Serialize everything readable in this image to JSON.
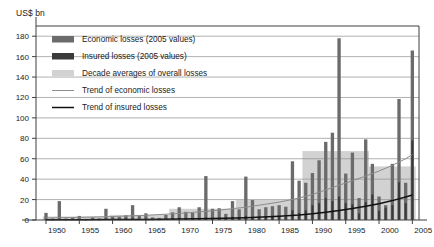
{
  "chart_data": {
    "type": "bar",
    "title": "",
    "subtitle": "",
    "xlabel": "",
    "ylabel": "US$ bn",
    "ylim": [
      0,
      190
    ],
    "xlim": [
      1948.5,
      2006.0
    ],
    "yticks": [
      0,
      20,
      40,
      60,
      80,
      100,
      120,
      140,
      160,
      180
    ],
    "xticks": [
      1950,
      1955,
      1960,
      1965,
      1970,
      1975,
      1980,
      1985,
      1990,
      1995,
      2000,
      2005
    ],
    "grid": true,
    "legend_position": "upper-left-inside",
    "x": [
      1950,
      1951,
      1952,
      1953,
      1954,
      1955,
      1956,
      1957,
      1958,
      1959,
      1960,
      1961,
      1962,
      1963,
      1964,
      1965,
      1966,
      1967,
      1968,
      1969,
      1970,
      1971,
      1972,
      1973,
      1974,
      1975,
      1976,
      1977,
      1978,
      1979,
      1980,
      1981,
      1982,
      1983,
      1984,
      1985,
      1986,
      1987,
      1988,
      1989,
      1990,
      1991,
      1992,
      1993,
      1994,
      1995,
      1996,
      1997,
      1998,
      1999,
      2000,
      2001,
      2002,
      2003,
      2004,
      2005
    ],
    "series": [
      {
        "name": "Economic losses (2005 values)",
        "color": "#6b6b6b",
        "values": [
          7.0,
          1.5,
          18.5,
          1.5,
          2.0,
          4.0,
          1.0,
          2.5,
          1.5,
          11.0,
          3.5,
          3.0,
          4.5,
          14.5,
          4.5,
          6.5,
          2.5,
          2.0,
          5.0,
          7.5,
          12.5,
          8.0,
          7.0,
          12.5,
          43.0,
          11.0,
          11.5,
          6.0,
          18.5,
          10.5,
          42.5,
          19.5,
          10.5,
          12.5,
          13.5,
          14.5,
          13.0,
          57.5,
          38.5,
          36.5,
          46.0,
          58.5,
          76.5,
          85.5,
          178.0,
          45.5,
          66.0,
          21.5,
          79.0,
          55.0,
          23.0,
          14.5,
          55.0,
          118.5,
          36.5,
          166.0
        ]
      },
      {
        "name": "Insured losses (2005 values)",
        "color": "#3a3a3a",
        "values": [
          1.0,
          0.3,
          1.5,
          0.3,
          0.5,
          0.8,
          0.2,
          0.4,
          0.3,
          1.2,
          0.6,
          0.5,
          1.5,
          1.5,
          0.8,
          1.2,
          0.5,
          0.4,
          0.8,
          1.5,
          2.0,
          1.5,
          1.5,
          1.5,
          2.5,
          2.0,
          2.0,
          1.2,
          3.0,
          2.5,
          4.0,
          3.0,
          2.0,
          3.0,
          3.5,
          4.0,
          3.0,
          9.5,
          7.0,
          9.5,
          14.5,
          16.5,
          21.5,
          18.5,
          23.0,
          16.5,
          15.5,
          6.5,
          17.5,
          25.0,
          9.0,
          12.0,
          14.5,
          37.0,
          16.5,
          78.0
        ]
      }
    ],
    "decade_averages": {
      "name": "Decade averages of overall losses",
      "color": "#d2d2d2",
      "bands": [
        {
          "start": 1950,
          "end": 1959,
          "value": 3.5
        },
        {
          "start": 1960,
          "end": 1968,
          "value": 5.0
        },
        {
          "start": 1969,
          "end": 1978,
          "value": 11.0
        },
        {
          "start": 1979,
          "end": 1988,
          "value": 19.5
        },
        {
          "start": 1989,
          "end": 1998,
          "value": 67.5
        },
        {
          "start": 1999,
          "end": 2005,
          "value": 52.5
        }
      ]
    },
    "trend_lines": [
      {
        "name": "Trend of economic losses",
        "color": "#8c8c8c",
        "points": [
          [
            1950,
            2.0
          ],
          [
            1955,
            2.6
          ],
          [
            1960,
            3.4
          ],
          [
            1965,
            4.6
          ],
          [
            1970,
            6.4
          ],
          [
            1975,
            9.0
          ],
          [
            1980,
            12.5
          ],
          [
            1985,
            17.5
          ],
          [
            1988,
            21.5
          ],
          [
            1990,
            25.0
          ],
          [
            1992,
            29.5
          ],
          [
            1994,
            34.0
          ],
          [
            1996,
            38.5
          ],
          [
            1998,
            43.0
          ],
          [
            2000,
            48.0
          ],
          [
            2002,
            53.5
          ],
          [
            2004,
            60.0
          ],
          [
            2005,
            64.0
          ]
        ]
      },
      {
        "name": "Trend of insured losses",
        "color": "#111111",
        "points": [
          [
            1950,
            0.2
          ],
          [
            1955,
            0.3
          ],
          [
            1960,
            0.4
          ],
          [
            1965,
            0.6
          ],
          [
            1970,
            0.9
          ],
          [
            1975,
            1.4
          ],
          [
            1980,
            2.2
          ],
          [
            1985,
            3.6
          ],
          [
            1988,
            4.8
          ],
          [
            1990,
            6.0
          ],
          [
            1992,
            7.5
          ],
          [
            1994,
            9.2
          ],
          [
            1996,
            11.2
          ],
          [
            1998,
            13.5
          ],
          [
            2000,
            16.0
          ],
          [
            2002,
            19.0
          ],
          [
            2004,
            22.5
          ],
          [
            2005,
            24.5
          ]
        ]
      }
    ]
  },
  "legend": {
    "items": [
      {
        "label": "Economic losses (2005 values)",
        "type": "swatch",
        "color": "#6b6b6b"
      },
      {
        "label": "Insured losses (2005 values)",
        "type": "swatch",
        "color": "#3a3a3a"
      },
      {
        "label": "Decade averages of overall losses",
        "type": "swatch",
        "color": "#d2d2d2"
      },
      {
        "label": "Trend of economic losses",
        "type": "line",
        "color": "#8c8c8c"
      },
      {
        "label": "Trend of insured losses",
        "type": "line",
        "color": "#111111"
      }
    ]
  },
  "axes": {
    "y_unit": "US$ bn"
  },
  "colors": {
    "frame": "#3f3f3f",
    "grid": "#8f8f8f",
    "text": "#1a1a1a",
    "background": "#ffffff"
  }
}
